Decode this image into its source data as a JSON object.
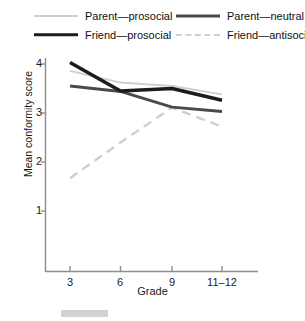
{
  "chart_data": {
    "type": "line",
    "title": "",
    "xlabel": "Grade",
    "ylabel": "Mean conformity score",
    "categories": [
      "3",
      "6",
      "9",
      "11–12"
    ],
    "xtick_labels": [
      "3",
      "6",
      "9",
      "11–12"
    ],
    "ytick_labels": [
      "1",
      "2",
      "3",
      "4"
    ],
    "ylim": [
      0.45,
      4.3
    ],
    "yticks": [
      1,
      2,
      3,
      4
    ],
    "grid": false,
    "legend_position": "top",
    "series": [
      {
        "name": "Parent—prosocial",
        "values": [
          3.86,
          3.62,
          3.55,
          3.38
        ],
        "color": "#cfcfcf",
        "style": "solid",
        "width": 2
      },
      {
        "name": "Friend—prosocial",
        "values": [
          4.03,
          3.45,
          3.5,
          3.26
        ],
        "color": "#1c1c1c",
        "style": "solid",
        "width": 3.5
      },
      {
        "name": "Parent—neutral",
        "values": [
          3.55,
          3.44,
          3.12,
          3.03
        ],
        "color": "#4a4a4a",
        "style": "solid",
        "width": 3
      },
      {
        "name": "Friend—antisocial",
        "values": [
          1.67,
          2.4,
          3.11,
          2.72
        ],
        "color": "#cfcfcf",
        "style": "dashed",
        "width": 2.4
      }
    ]
  },
  "legend": {
    "items": [
      {
        "label": "Parent—prosocial",
        "swatch": "solid-light"
      },
      {
        "label": "Friend—prosocial",
        "swatch": "solid-black"
      },
      {
        "label": "Parent—neutral",
        "swatch": "solid-dark"
      },
      {
        "label": "Friend—antisocial",
        "swatch": "dashed-light"
      }
    ]
  },
  "axes": {
    "y_label": "Mean conformity score",
    "x_label": "Grade",
    "y_ticks": [
      "4",
      "3",
      "2",
      "1"
    ],
    "x_ticks": [
      "3",
      "6",
      "9",
      "11–12"
    ]
  }
}
